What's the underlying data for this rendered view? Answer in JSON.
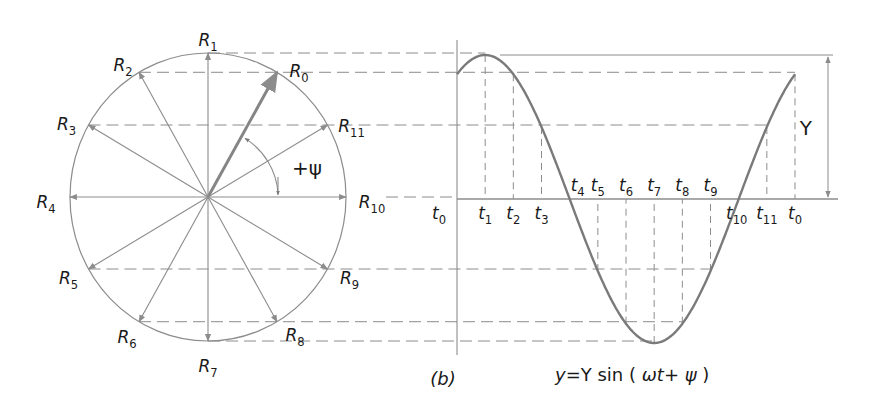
{
  "figure": {
    "panel_label": "(b)",
    "equation": {
      "lhs": "y",
      "eq": "=",
      "Y": "Y",
      "fn": "sin",
      "open": "(",
      "omega_t": "ωt",
      "plus": "+",
      "psi": "ψ",
      "close": ")"
    },
    "amplitude_label": "Y",
    "phase_label": "+ψ",
    "colors": {
      "line": "#8c8c8c",
      "curve": "#7a7a7a",
      "text": "#1a1a1a",
      "background": "#ffffff"
    }
  },
  "phasor": {
    "center": [
      208,
      197
    ],
    "rx": 138,
    "ry": 144,
    "rotating_vectors": [
      {
        "name": "R",
        "sub": "0",
        "angle_deg": 60
      },
      {
        "name": "R",
        "sub": "1",
        "angle_deg": 90
      },
      {
        "name": "R",
        "sub": "2",
        "angle_deg": 120
      },
      {
        "name": "R",
        "sub": "3",
        "angle_deg": 150
      },
      {
        "name": "R",
        "sub": "4",
        "angle_deg": 180
      },
      {
        "name": "R",
        "sub": "5",
        "angle_deg": 210
      },
      {
        "name": "R",
        "sub": "6",
        "angle_deg": 240
      },
      {
        "name": "R",
        "sub": "7",
        "angle_deg": 270
      },
      {
        "name": "R",
        "sub": "8",
        "angle_deg": 300
      },
      {
        "name": "R",
        "sub": "9",
        "angle_deg": 330
      },
      {
        "name": "R",
        "sub": "10",
        "angle_deg": 0
      },
      {
        "name": "R",
        "sub": "11",
        "angle_deg": 30
      }
    ]
  },
  "waveform": {
    "axis_x": 457,
    "baseline_y": 199,
    "amplitude_px": 144,
    "period_px": 338,
    "phase_deg": 60,
    "time_labels": [
      {
        "name": "t",
        "sub": "0"
      },
      {
        "name": "t",
        "sub": "1"
      },
      {
        "name": "t",
        "sub": "2"
      },
      {
        "name": "t",
        "sub": "3"
      },
      {
        "name": "t",
        "sub": "4"
      },
      {
        "name": "t",
        "sub": "5"
      },
      {
        "name": "t",
        "sub": "6"
      },
      {
        "name": "t",
        "sub": "7"
      },
      {
        "name": "t",
        "sub": "8"
      },
      {
        "name": "t",
        "sub": "9"
      },
      {
        "name": "t",
        "sub": "10"
      },
      {
        "name": "t",
        "sub": "11"
      },
      {
        "name": "t",
        "sub": "0"
      }
    ]
  }
}
